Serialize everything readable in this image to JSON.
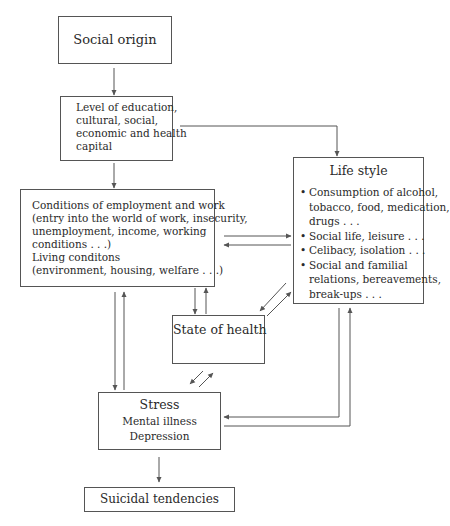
{
  "diagram": {
    "nodes": {
      "social_origin": {
        "label": "Social origin"
      },
      "capital": {
        "lines": [
          "Level of education,",
          "cultural, social,",
          "economic and health",
          "capital"
        ]
      },
      "conditions": {
        "lines": [
          "Conditions of employment and work",
          "(entry into the world of work, insecurity,",
          "unemployment, income, working",
          "conditions . . .)",
          "Living conditons",
          "(environment, housing, welfare . . .)"
        ]
      },
      "life_style": {
        "title": "Life style",
        "bullets": [
          [
            "Consumption of alcohol,",
            "tobacco, food, medication,",
            "drugs . . ."
          ],
          [
            "Social life, leisure . . ."
          ],
          [
            "Celibacy, isolation . . ."
          ],
          [
            "Social and familial",
            "relations, bereavements,",
            "break-ups . . ."
          ]
        ]
      },
      "state_of_health": {
        "label": "State of health"
      },
      "stress": {
        "lines": [
          "Stress",
          "Mental illness",
          "Depression"
        ]
      },
      "suicidal": {
        "label": "Suicidal tendencies"
      }
    },
    "edges": [
      {
        "from": "social_origin",
        "to": "capital"
      },
      {
        "from": "capital",
        "to": "conditions"
      },
      {
        "from": "capital",
        "to": "life_style"
      },
      {
        "from": "conditions",
        "to": "life_style"
      },
      {
        "from": "life_style",
        "to": "conditions"
      },
      {
        "from": "conditions",
        "to": "state_of_health"
      },
      {
        "from": "state_of_health",
        "to": "conditions"
      },
      {
        "from": "life_style",
        "to": "state_of_health"
      },
      {
        "from": "state_of_health",
        "to": "life_style"
      },
      {
        "from": "conditions",
        "to": "stress"
      },
      {
        "from": "stress",
        "to": "conditions"
      },
      {
        "from": "state_of_health",
        "to": "stress"
      },
      {
        "from": "stress",
        "to": "state_of_health"
      },
      {
        "from": "life_style",
        "to": "stress"
      },
      {
        "from": "stress",
        "to": "life_style"
      },
      {
        "from": "stress",
        "to": "suicidal"
      }
    ],
    "colors": {
      "line": "#555555",
      "text": "#2a2a2a",
      "background": "#ffffff"
    }
  }
}
